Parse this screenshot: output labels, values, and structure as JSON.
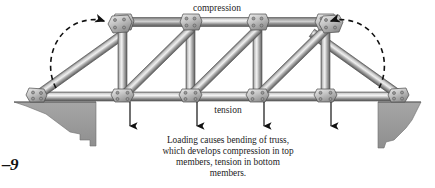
{
  "figure": {
    "number_label": "–9",
    "title_top_label": "compression",
    "title_bottom_label": "tension",
    "caption_lines": [
      "Loading causes bending of truss,",
      "which develops compression in top",
      "members, tension in bottom",
      "members."
    ],
    "caption_full": "Loading causes bending of truss, which develops compression in top members, tension in bottom members.",
    "icons": {
      "left_moment_arrow": "curved-dashed-arrow-clockwise",
      "right_moment_arrow": "curved-dashed-arrow-counterclockwise",
      "load_arrow": "down-arrow"
    },
    "colors": {
      "background": "#ffffff",
      "ground_fill": "#9b9b9b",
      "ground_stroke": "#6e6e6e",
      "steel_light": "#f2f2f2",
      "steel_mid": "#b9b9b9",
      "steel_dark": "#6b6b6b",
      "gusset_fill": "#cfcfcf",
      "rivet": "#8a8a8a",
      "arrow": "#111111",
      "text": "#262626"
    },
    "geometry": {
      "top_chord_y": 22,
      "bottom_chord_y": 96,
      "left_support_x": 32,
      "right_support_x": 403,
      "panel_joints_top_x": [
        122,
        190,
        257,
        325
      ],
      "panel_joints_bottom_x": [
        122,
        190,
        257,
        325
      ],
      "load_arrow_x": [
        130,
        197,
        264,
        331
      ],
      "load_arrow_top_y": 100,
      "load_arrow_bottom_y": 128
    },
    "labels": {
      "load_count": 4,
      "panel_count": 3,
      "end_diagonal_count": 2
    }
  }
}
